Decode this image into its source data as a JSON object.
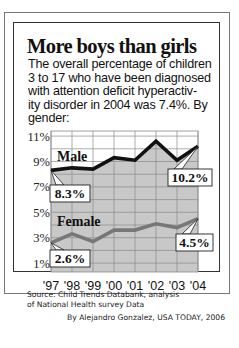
{
  "title": "More boys than girls",
  "description_lines": [
    "The overall percentage of children",
    "3 to 17 who have been diagnosed",
    "with attention deficit hyperactiv-",
    "ity disorder in 2004 was 7.4%. By",
    "gender:"
  ],
  "source_lines": [
    "Source: Child Trends Databank, analysis",
    "of National Health survey Data"
  ],
  "byline": "By Alejandro Gonzalez, USA TODAY, 2006",
  "colors": {
    "male_line": "#111111",
    "female_line": "#777777",
    "plot_fill": "#c8c8c8",
    "grid": "#8a8a8a",
    "frame": "#333333"
  },
  "chart_data": {
    "type": "line",
    "title": "More boys than girls",
    "xlabel": "",
    "ylabel": "",
    "categories": [
      "'97",
      "'98",
      "'99",
      "'00",
      "'01",
      "'02",
      "'03",
      "'04"
    ],
    "y_ticks": [
      "11%",
      "9%",
      "7%",
      "5%",
      "3%",
      "1%"
    ],
    "y_tick_values": [
      11,
      9,
      7,
      5,
      3,
      1
    ],
    "ylim": [
      0.3,
      11.4
    ],
    "grid": true,
    "legend": "inline labels",
    "series": [
      {
        "name": "Male",
        "values": [
          8.3,
          8.5,
          8.4,
          9.3,
          9.1,
          10.6,
          9.1,
          10.2
        ]
      },
      {
        "name": "Female",
        "values": [
          2.6,
          3.3,
          2.7,
          3.6,
          3.6,
          4.1,
          3.8,
          4.5
        ]
      }
    ],
    "annotations": [
      {
        "series": "Male",
        "x": "'97",
        "label": "8.3%"
      },
      {
        "series": "Male",
        "x": "'04",
        "label": "10.2%"
      },
      {
        "series": "Female",
        "x": "'97",
        "label": "2.6%"
      },
      {
        "series": "Female",
        "x": "'04",
        "label": "4.5%"
      }
    ]
  }
}
